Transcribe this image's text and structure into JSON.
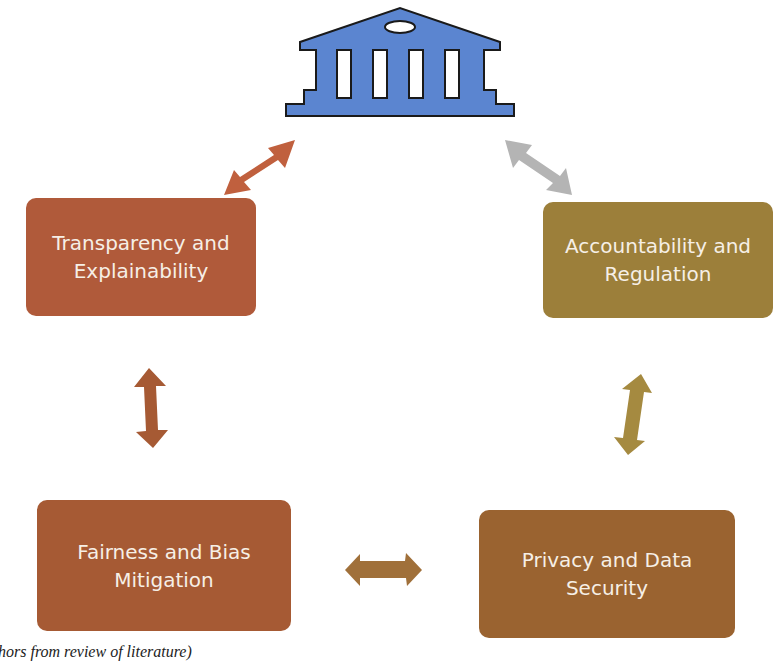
{
  "diagram": {
    "center_icon": "institution-building-icon",
    "nodes": [
      {
        "id": "transparency",
        "label": "Transparency and Explainability",
        "color": "#b05a3a"
      },
      {
        "id": "accountability",
        "label": "Accountability and Regulation",
        "color": "#9c7f3a"
      },
      {
        "id": "fairness",
        "label": "Fairness and Bias Mitigation",
        "color": "#a65a34"
      },
      {
        "id": "privacy",
        "label": "Privacy and Data Security",
        "color": "#9a6330"
      }
    ],
    "connectors": [
      {
        "from": "institution",
        "to": "transparency",
        "type": "double-arrow",
        "color": "#c0603e"
      },
      {
        "from": "institution",
        "to": "accountability",
        "type": "double-arrow",
        "color": "#b4b4b4"
      },
      {
        "from": "transparency",
        "to": "fairness",
        "type": "double-arrow",
        "color": "#a65a34"
      },
      {
        "from": "accountability",
        "to": "privacy",
        "type": "double-arrow",
        "color": "#a58a40"
      },
      {
        "from": "fairness",
        "to": "privacy",
        "type": "double-arrow",
        "color": "#a0703a"
      }
    ],
    "icon_color": "#5b85d0"
  },
  "caption": "hors from review of literature)"
}
